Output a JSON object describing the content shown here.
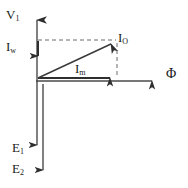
{
  "diagram": {
    "type": "phasor-vector-diagram",
    "background_color": "#ffffff",
    "line_color": "#3a3a3a",
    "text_color": "#1a1a1a",
    "labels": {
      "v1": "V",
      "v1_sub": "1",
      "iw": "I",
      "iw_sub": "w",
      "io": "I",
      "io_sub": "O",
      "im": "I",
      "im_sub": "m",
      "phi": "Φ",
      "e1": "E",
      "e1_sub": "1",
      "e2": "E",
      "e2_sub": "2"
    },
    "vectors": [
      {
        "name": "V1",
        "label": "V₁",
        "description": "Applied primary voltage, vertical axis pointing up",
        "style": "solid",
        "from": [
          37,
          81
        ],
        "to": [
          37,
          13
        ],
        "arrowhead": true
      },
      {
        "name": "Phi",
        "label": "Φ",
        "description": "Main flux, horizontal axis pointing right",
        "style": "solid",
        "from": [
          37,
          81
        ],
        "to": [
          160,
          81
        ],
        "arrowhead": true
      },
      {
        "name": "Iw",
        "label": "Iₓᵥ",
        "description": "Working / core-loss current component, vertical downward from top dashed line",
        "style": "solid",
        "from": [
          37,
          40
        ],
        "to": [
          37,
          62
        ],
        "arrowhead": true
      },
      {
        "name": "Im",
        "label": "Iₘ",
        "description": "Magnetizing current component, horizontal to the right",
        "style": "solid",
        "from": [
          37,
          78
        ],
        "to": [
          116,
          78
        ],
        "arrowhead": true
      },
      {
        "name": "IO",
        "label": "Iₒ",
        "description": "No-load current, diagonal resultant from origin to top-right corner",
        "style": "solid",
        "from": [
          37,
          78
        ],
        "to": [
          116,
          41
        ],
        "arrowhead": true
      },
      {
        "name": "E1",
        "label": "E₁",
        "description": "Primary induced EMF, vertical downward",
        "style": "solid",
        "from": [
          37,
          81
        ],
        "to": [
          37,
          152
        ],
        "arrowhead": true
      },
      {
        "name": "E2",
        "label": "E₂",
        "description": "Secondary induced EMF, vertical downward longer",
        "style": "solid",
        "from": [
          43,
          81
        ],
        "to": [
          43,
          178
        ],
        "arrowhead": true
      }
    ],
    "construction_lines": [
      {
        "name": "top-dashed",
        "description": "Dashed horizontal line from V1 axis to IO tip",
        "style": "dashed",
        "from": [
          37,
          40
        ],
        "to": [
          116,
          40
        ]
      },
      {
        "name": "right-dashed",
        "description": "Dashed vertical line from IO tip down to Im arrow tip",
        "style": "dashed",
        "from": [
          117,
          41
        ],
        "to": [
          117,
          78
        ]
      }
    ],
    "axes": {
      "vertical_label_top": "V1",
      "vertical_label_bottom": [
        "E1",
        "E2"
      ],
      "horizontal_label_right": "Phi"
    }
  }
}
